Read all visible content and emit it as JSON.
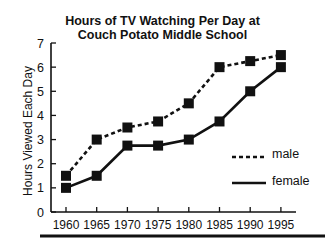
{
  "chart_data": {
    "type": "line",
    "title": "Hours of TV Watching Per Day at Couch Potato Middle School",
    "title_lines": [
      "Hours of TV Watching Per Day at",
      "Couch Potato Middle School"
    ],
    "xlabel": "",
    "ylabel": "Hours Viewed Each Day",
    "x": [
      1960,
      1965,
      1970,
      1975,
      1980,
      1985,
      1990,
      1995
    ],
    "x_tick_labels": [
      "1960",
      "1965",
      "1970",
      "1975",
      "1980",
      "1985",
      "1990",
      "1995"
    ],
    "y_tick_labels": [
      "0",
      "1",
      "2",
      "3",
      "4",
      "5",
      "6",
      "7"
    ],
    "ylim": [
      0,
      7
    ],
    "grid": false,
    "legend_position": "lower right inside",
    "series": [
      {
        "name": "male",
        "style": "dashed",
        "marker": "square",
        "color": "#111111",
        "values": [
          1.5,
          3.0,
          3.5,
          3.75,
          4.5,
          6.0,
          6.25,
          6.5
        ]
      },
      {
        "name": "female",
        "style": "solid",
        "marker": "square",
        "color": "#111111",
        "values": [
          1.0,
          1.5,
          2.75,
          2.75,
          3.0,
          3.75,
          5.0,
          6.0
        ]
      }
    ]
  }
}
